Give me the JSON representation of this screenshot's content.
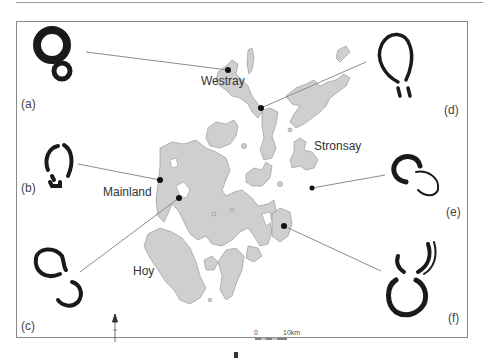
{
  "figure": {
    "type": "map-diagram",
    "place_labels": [
      {
        "id": "westray",
        "text": "Westray"
      },
      {
        "id": "stronsay",
        "text": "Stronsay"
      },
      {
        "id": "mainland",
        "text": "Mainland"
      },
      {
        "id": "hoy",
        "text": "Hoy"
      }
    ],
    "panels": [
      {
        "id": "a",
        "label": "(a)"
      },
      {
        "id": "b",
        "label": "(b)"
      },
      {
        "id": "c",
        "label": "(c)"
      },
      {
        "id": "d",
        "label": "(d)"
      },
      {
        "id": "e",
        "label": "(e)"
      },
      {
        "id": "f",
        "label": "(f)"
      }
    ],
    "scale_bar": {
      "start": "0",
      "end": "10km"
    },
    "north_arrow": "north-arrow",
    "colors": {
      "land": "#cfcfcf",
      "land_outline": "#8f8f8f",
      "outline_shapes": "#1a1a1a",
      "leader_lines": "#8c8c8c",
      "frame": "#8a8a8a"
    }
  }
}
